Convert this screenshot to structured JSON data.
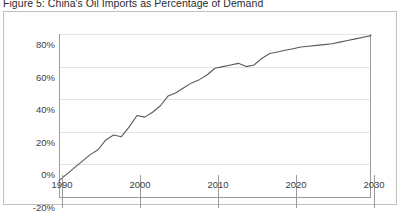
{
  "figure": {
    "title": "Figure 5: China's Oil Imports as Percentage of Demand"
  },
  "colors": {
    "line": "#595959",
    "grid": "#e3e3e3",
    "axis": "#9a9a9a",
    "frame": "#bfbfbf",
    "text": "#404040",
    "background": "#ffffff"
  },
  "chart_data": {
    "type": "line",
    "title": "Figure 5: China's Oil Imports as Percentage of Demand",
    "xlabel": "",
    "ylabel": "",
    "xlim": [
      1990,
      2030
    ],
    "ylim": [
      -20,
      80
    ],
    "grid": true,
    "legend": false,
    "legend_position": "none",
    "xticks": [
      1990,
      2000,
      2010,
      2020,
      2030
    ],
    "xticklabels": [
      "1990",
      "2000",
      "2010",
      "2020",
      "2030"
    ],
    "yticks": [
      -20,
      0,
      20,
      40,
      60,
      80
    ],
    "yticklabels": [
      "-20%",
      "0%",
      "20%",
      "40%",
      "60%",
      "80%"
    ],
    "series": [
      {
        "name": "China oil imports as percentage of demand",
        "x": [
          1990,
          1991,
          1992,
          1993,
          1994,
          1995,
          1996,
          1997,
          1998,
          1999,
          2000,
          2001,
          2002,
          2003,
          2004,
          2005,
          2006,
          2007,
          2008,
          2009,
          2010,
          2011,
          2012,
          2013,
          2014,
          2015,
          2016,
          2017,
          2018,
          2019,
          2020,
          2021,
          2022,
          2023,
          2024,
          2025,
          2026,
          2027,
          2028,
          2029,
          2030
        ],
        "values": [
          -10,
          -6,
          -2,
          2,
          6,
          9,
          15,
          18,
          17,
          23,
          30,
          29,
          32,
          36,
          42,
          44,
          47,
          50,
          52,
          55,
          59,
          60,
          61,
          62,
          60,
          61,
          65,
          68,
          69,
          70,
          71,
          72,
          72.5,
          73,
          73.5,
          74,
          75,
          76,
          77,
          78,
          79
        ]
      }
    ]
  }
}
